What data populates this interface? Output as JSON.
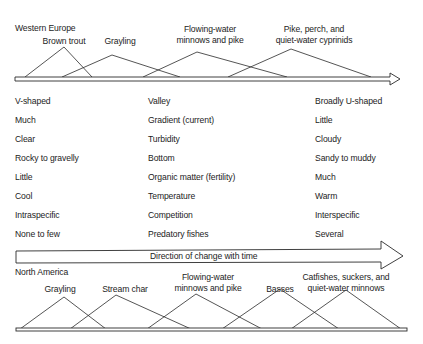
{
  "top_section": {
    "region_label": "Western Europe",
    "zones": [
      {
        "label_lines": [
          "Brown trout"
        ],
        "left_x": 25,
        "peak_x": 64,
        "peak_y": 47,
        "right_x": 92,
        "label_x": 64,
        "label_y": 36
      },
      {
        "label_lines": [
          "Grayling"
        ],
        "left_x": 62,
        "peak_x": 112,
        "peak_y": 55,
        "right_x": 180,
        "label_x": 120,
        "label_y": 36
      },
      {
        "label_lines": [
          "Flowing-water",
          "minnows and pike"
        ],
        "left_x": 143,
        "peak_x": 197,
        "peak_y": 52,
        "right_x": 287,
        "label_x": 210,
        "label_y": 24
      },
      {
        "label_lines": [
          "Pike, perch, and",
          "quiet-water cyprinids"
        ],
        "left_x": 228,
        "peak_x": 291,
        "peak_y": 49,
        "right_x": 371,
        "label_x": 314,
        "label_y": 24
      }
    ]
  },
  "characteristics": {
    "rows": [
      {
        "upstream": "V-shaped",
        "factor": "Valley",
        "downstream": "Broadly U-shaped"
      },
      {
        "upstream": "Much",
        "factor": "Gradient (current)",
        "downstream": "Little"
      },
      {
        "upstream": "Clear",
        "factor": "Turbidity",
        "downstream": "Cloudy"
      },
      {
        "upstream": "Rocky to gravelly",
        "factor": "Bottom",
        "downstream": "Sandy to muddy"
      },
      {
        "upstream": "Little",
        "factor": "Organic matter (fertility)",
        "downstream": "Much"
      },
      {
        "upstream": "Cool",
        "factor": "Temperature",
        "downstream": "Warm"
      },
      {
        "upstream": "Intraspecific",
        "factor": "Competition",
        "downstream": "Interspecific"
      },
      {
        "upstream": "None to few",
        "factor": "Predatory fishes",
        "downstream": "Several"
      }
    ]
  },
  "time_arrow": {
    "label": "Direction of change with time"
  },
  "bottom_section": {
    "region_label": "North America",
    "zones": [
      {
        "label_lines": [
          "Grayling"
        ],
        "left_x": 20,
        "peak_x": 64,
        "peak_y": 297,
        "right_x": 106,
        "label_x": 60,
        "label_y": 284
      },
      {
        "label_lines": [
          "Stream char"
        ],
        "left_x": 70,
        "peak_x": 116,
        "peak_y": 295,
        "right_x": 191,
        "label_x": 125,
        "label_y": 284
      },
      {
        "label_lines": [
          "Flowing-water",
          "minnows and pike"
        ],
        "left_x": 147,
        "peak_x": 196,
        "peak_y": 294,
        "right_x": 262,
        "label_x": 208,
        "label_y": 272
      },
      {
        "label_lines": [
          "Basses"
        ],
        "left_x": 222,
        "peak_x": 280,
        "peak_y": 289,
        "right_x": 339,
        "label_x": 280,
        "label_y": 284
      },
      {
        "label_lines": [
          "Catfishes, suckers, and",
          "quiet-water minnows"
        ],
        "left_x": 291,
        "peak_x": 346,
        "peak_y": 290,
        "right_x": 401,
        "label_x": 346,
        "label_y": 272
      }
    ]
  }
}
